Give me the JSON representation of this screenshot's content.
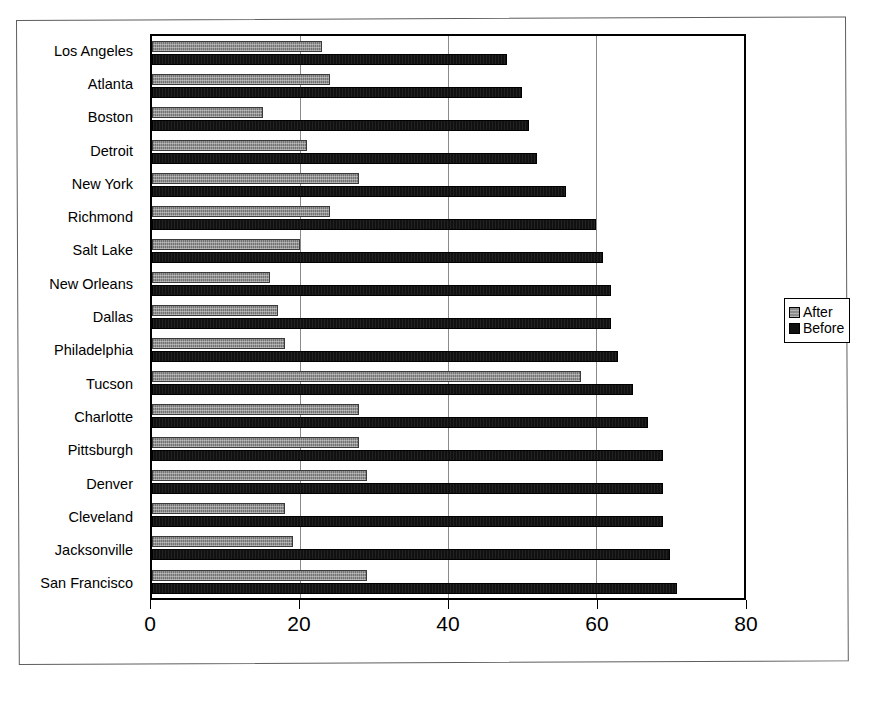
{
  "chart_data": {
    "type": "bar",
    "orientation": "horizontal",
    "title": "",
    "xlabel": "",
    "ylabel": "",
    "xlim": [
      0,
      80
    ],
    "xticks": [
      0,
      20,
      40,
      60,
      80
    ],
    "xtick_labels": [
      "0",
      "20",
      "40",
      "60",
      "80"
    ],
    "grid": "vertical",
    "legend_position": "right",
    "categories": [
      "Los Angeles",
      "Atlanta",
      "Boston",
      "Detroit",
      "New York",
      "Richmond",
      "Salt Lake",
      "New Orleans",
      "Dallas",
      "Philadelphia",
      "Tucson",
      "Charlotte",
      "Pittsburgh",
      "Denver",
      "Cleveland",
      "Jacksonville",
      "San Francisco"
    ],
    "series": [
      {
        "name": "After",
        "color": "#8c8c8c",
        "values": [
          23,
          24,
          15,
          21,
          28,
          24,
          20,
          16,
          17,
          18,
          58,
          28,
          28,
          29,
          18,
          19,
          29
        ]
      },
      {
        "name": "Before",
        "color": "#111111",
        "values": [
          48,
          50,
          51,
          52,
          56,
          60,
          61,
          62,
          62,
          63,
          65,
          67,
          69,
          69,
          69,
          70,
          71
        ]
      }
    ]
  },
  "legend": {
    "entries": [
      {
        "label": "After",
        "icon": "legend-swatch-gray"
      },
      {
        "label": "Before",
        "icon": "legend-swatch-black"
      }
    ]
  }
}
